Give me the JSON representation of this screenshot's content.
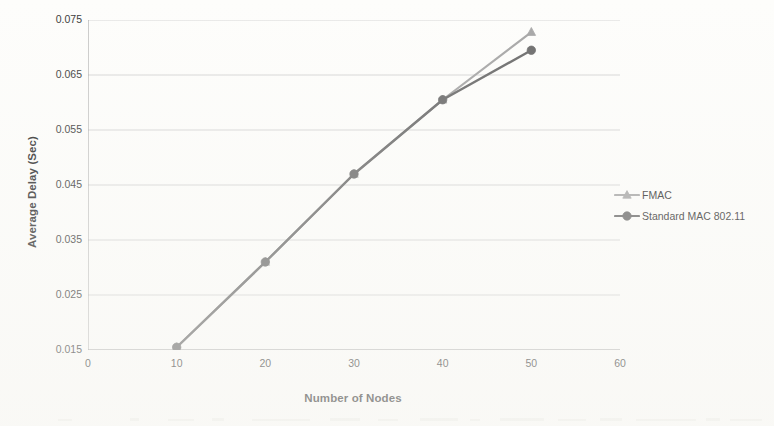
{
  "chart_data": {
    "type": "line",
    "title": "",
    "subtitle": "",
    "xlabel": "Number of Nodes",
    "ylabel": "Average Delay (Sec)",
    "x": [
      10,
      20,
      30,
      40,
      50
    ],
    "xlim": [
      0,
      60
    ],
    "ylim": [
      0.015,
      0.075
    ],
    "xticks": [
      0,
      10,
      20,
      30,
      40,
      50,
      60
    ],
    "yticks": [
      0.015,
      0.025,
      0.035,
      0.045,
      0.055,
      0.065,
      0.075
    ],
    "xtick_labels": [
      "0",
      "10",
      "20",
      "30",
      "40",
      "50",
      "60"
    ],
    "ytick_labels": [
      "0.015",
      "0.025",
      "0.035",
      "0.045",
      "0.055",
      "0.065",
      "0.075"
    ],
    "grid": "horizontal",
    "legend_position": "right",
    "series": [
      {
        "name": "FMAC",
        "marker": "triangle",
        "color": "#a6a6a6",
        "values": [
          0.0155,
          0.031,
          0.047,
          0.0605,
          0.0728
        ]
      },
      {
        "name": "Standard MAC 802.11",
        "marker": "circle",
        "color": "#6b6b6b",
        "values": [
          0.0155,
          0.031,
          0.047,
          0.0605,
          0.0695
        ]
      }
    ]
  },
  "axes": {
    "y_title": "Average Delay (Sec)",
    "x_title": "Number of Nodes"
  },
  "legend": {
    "items": [
      {
        "label": "FMAC",
        "color": "#a6a6a6",
        "marker": "triangle"
      },
      {
        "label": "Standard MAC 802.11",
        "color": "#6b6b6b",
        "marker": "circle"
      }
    ]
  },
  "colors": {
    "background": "#fdfdfb",
    "gridline": "#c9c9c9",
    "axis": "#9a9a9a",
    "text": "#2b2b2b",
    "series_fmac": "#a6a6a6",
    "series_mac": "#6b6b6b"
  }
}
